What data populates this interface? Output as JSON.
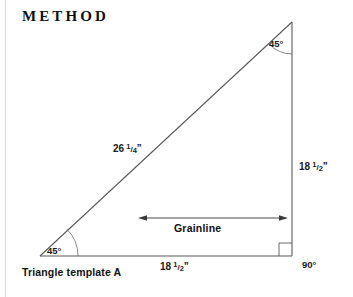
{
  "heading": {
    "title": "METHOD"
  },
  "figure": {
    "caption": "Triangle template A",
    "shape_name": "right-triangle-template",
    "line_color": "#5a5a5a",
    "text_color": "#1a1a1a",
    "background_color": "#ffffff",
    "rule_color": "#dcdcdc"
  },
  "angles": [
    {
      "name": "apex-angle",
      "value": "45°",
      "position": "top-right"
    },
    {
      "name": "base-left-angle",
      "value": "45°",
      "position": "bottom-left"
    },
    {
      "name": "right-angle",
      "value": "90°",
      "position": "bottom-right"
    }
  ],
  "dimensions": [
    {
      "name": "hypotenuse",
      "whole": "26",
      "numerator": "1",
      "slash": "/",
      "denominator": "4",
      "unit": "”",
      "full": "26 1/4”"
    },
    {
      "name": "vertical-leg",
      "whole": "18",
      "numerator": "1",
      "slash": "/",
      "denominator": "2",
      "unit": "”",
      "full": "18 1/2”"
    },
    {
      "name": "bottom-leg",
      "whole": "18",
      "numerator": "1",
      "slash": "/",
      "denominator": "2",
      "unit": "”",
      "full": "18 1/2”"
    }
  ],
  "grainline": {
    "label": "Grainline",
    "arrow": "double-headed-horizontal-arrow"
  }
}
